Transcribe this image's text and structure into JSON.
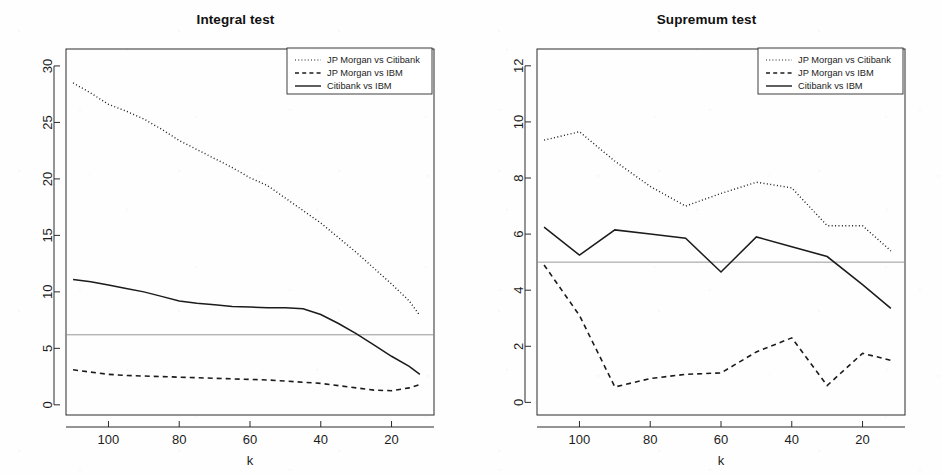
{
  "figure": {
    "background_color": "#fefefe",
    "ink_color": "#1b1b1b",
    "reference_line_color": "#8c8c8c"
  },
  "legend": {
    "entries": [
      {
        "label": "JP Morgan vs Citibank",
        "style": "dotted"
      },
      {
        "label": "JP Morgan vs IBM",
        "style": "dashed"
      },
      {
        "label": "Citibank vs IBM",
        "style": "solid"
      }
    ]
  },
  "chart_data": [
    {
      "type": "line",
      "panel": "left",
      "title": "Integral test",
      "xlabel": "k",
      "ylabel": "",
      "xlim": [
        112,
        8
      ],
      "ylim": [
        -0.9,
        31.5
      ],
      "x_ticks": [
        100,
        80,
        60,
        40,
        20
      ],
      "y_ticks": [
        0,
        5,
        10,
        15,
        20,
        25,
        30
      ],
      "x_reversed": true,
      "grid": false,
      "legend_position": "top-right",
      "reference_line": {
        "y": 6.2,
        "label": ""
      },
      "x": [
        110,
        105,
        100,
        95,
        90,
        85,
        80,
        75,
        70,
        65,
        60,
        55,
        50,
        45,
        40,
        35,
        30,
        25,
        20,
        15,
        12
      ],
      "series": [
        {
          "name": "JP Morgan vs Citibank",
          "style": "dotted",
          "values": [
            28.5,
            27.6,
            26.6,
            26.0,
            25.3,
            24.4,
            23.4,
            22.6,
            21.8,
            21.0,
            20.1,
            19.4,
            18.3,
            17.2,
            16.1,
            14.8,
            13.5,
            12.1,
            10.7,
            9.2,
            7.9
          ]
        },
        {
          "name": "JP Morgan vs IBM",
          "style": "dashed",
          "values": [
            3.1,
            2.9,
            2.7,
            2.6,
            2.55,
            2.5,
            2.45,
            2.4,
            2.35,
            2.3,
            2.25,
            2.2,
            2.1,
            2.0,
            1.9,
            1.7,
            1.5,
            1.3,
            1.25,
            1.5,
            1.8
          ]
        },
        {
          "name": "Citibank vs IBM",
          "style": "solid",
          "values": [
            11.1,
            10.9,
            10.6,
            10.3,
            10.0,
            9.6,
            9.2,
            9.0,
            8.85,
            8.7,
            8.65,
            8.6,
            8.6,
            8.5,
            8.0,
            7.2,
            6.3,
            5.3,
            4.3,
            3.4,
            2.7
          ]
        }
      ]
    },
    {
      "type": "line",
      "panel": "right",
      "title": "Supremum test",
      "xlabel": "k",
      "ylabel": "",
      "xlim": [
        112,
        8
      ],
      "ylim": [
        -0.45,
        12.6
      ],
      "x_ticks": [
        100,
        80,
        60,
        40,
        20
      ],
      "y_ticks": [
        0,
        2,
        4,
        6,
        8,
        10,
        12
      ],
      "x_reversed": true,
      "grid": false,
      "legend_position": "top-right",
      "reference_line": {
        "y": 5.0,
        "label": ""
      },
      "x": [
        110,
        100,
        90,
        80,
        70,
        60,
        50,
        40,
        30,
        20,
        12
      ],
      "series": [
        {
          "name": "JP Morgan vs Citibank",
          "style": "dotted",
          "values": [
            9.35,
            9.65,
            8.6,
            7.7,
            7.0,
            7.45,
            7.85,
            7.65,
            6.3,
            6.3,
            5.4
          ]
        },
        {
          "name": "JP Morgan vs IBM",
          "style": "dashed",
          "values": [
            4.9,
            3.1,
            0.55,
            0.85,
            1.0,
            1.05,
            1.8,
            2.3,
            0.6,
            1.75,
            1.5
          ]
        },
        {
          "name": "Citibank vs IBM",
          "style": "solid",
          "values": [
            6.25,
            5.25,
            6.15,
            6.0,
            5.85,
            4.65,
            5.9,
            5.55,
            5.2,
            4.2,
            3.35
          ]
        }
      ]
    }
  ]
}
